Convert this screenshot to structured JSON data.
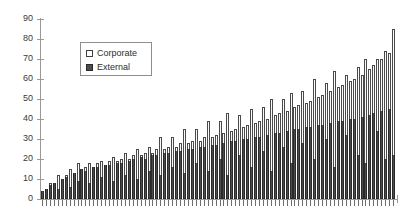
{
  "chart_data": {
    "type": "bar",
    "subtype": "stacked-bar",
    "title": "",
    "xlabel": "",
    "ylabel": "",
    "ylim": [
      0,
      90
    ],
    "ytick_labels": [
      "90",
      "80",
      "70",
      "60",
      "50",
      "40",
      "30",
      "20",
      "10",
      "0"
    ],
    "ytick_values": [
      90,
      80,
      70,
      60,
      50,
      40,
      30,
      20,
      10,
      0
    ],
    "grid": false,
    "legend_position": "upper-left-inside",
    "xtick_labels": [],
    "n_categories": 90,
    "categories": [
      "1",
      "2",
      "3",
      "4",
      "5",
      "6",
      "7",
      "8",
      "9",
      "10",
      "11",
      "12",
      "13",
      "14",
      "15",
      "16",
      "17",
      "18",
      "19",
      "20",
      "21",
      "22",
      "23",
      "24",
      "25",
      "26",
      "27",
      "28",
      "29",
      "30",
      "31",
      "32",
      "33",
      "34",
      "35",
      "36",
      "37",
      "38",
      "39",
      "40",
      "41",
      "42",
      "43",
      "44",
      "45",
      "46",
      "47",
      "48",
      "49",
      "50",
      "51",
      "52",
      "53",
      "54",
      "55",
      "56",
      "57",
      "58",
      "59",
      "60",
      "61",
      "62",
      "63",
      "64",
      "65",
      "66",
      "67",
      "68",
      "69",
      "70",
      "71",
      "72",
      "73",
      "74",
      "75",
      "76",
      "77",
      "78",
      "79",
      "80",
      "81",
      "82",
      "83",
      "84",
      "85",
      "86",
      "87",
      "88",
      "89",
      "90"
    ],
    "series": [
      {
        "name": "External",
        "color": "#4c4c4c",
        "values": [
          4,
          5,
          7,
          8,
          5,
          10,
          11,
          6,
          13,
          9,
          15,
          14,
          8,
          16,
          16,
          11,
          17,
          17,
          9,
          18,
          18,
          12,
          19,
          20,
          10,
          21,
          20,
          14,
          22,
          22,
          12,
          23,
          23,
          16,
          24,
          24,
          13,
          25,
          25,
          18,
          26,
          26,
          14,
          27,
          27,
          20,
          28,
          12,
          29,
          29,
          22,
          30,
          30,
          16,
          31,
          31,
          24,
          32,
          14,
          33,
          33,
          26,
          34,
          18,
          35,
          35,
          28,
          36,
          36,
          20,
          37,
          37,
          30,
          38,
          16,
          39,
          39,
          32,
          40,
          40,
          22,
          41,
          18,
          42,
          43,
          34,
          44,
          20,
          45,
          22
        ]
      },
      {
        "name": "Corporate",
        "color": "#fbfbfb",
        "values": [
          0,
          0,
          1,
          0,
          7,
          0,
          1,
          9,
          0,
          9,
          0,
          2,
          10,
          0,
          2,
          8,
          0,
          2,
          12,
          1,
          2,
          11,
          1,
          2,
          15,
          1,
          3,
          12,
          1,
          3,
          19,
          2,
          3,
          15,
          2,
          4,
          22,
          3,
          4,
          17,
          3,
          5,
          25,
          4,
          5,
          19,
          5,
          31,
          5,
          6,
          20,
          6,
          7,
          29,
          7,
          8,
          22,
          8,
          36,
          9,
          10,
          24,
          10,
          35,
          11,
          12,
          26,
          12,
          13,
          40,
          14,
          15,
          28,
          16,
          48,
          17,
          18,
          30,
          19,
          20,
          44,
          21,
          52,
          23,
          24,
          36,
          26,
          54,
          28,
          63
        ]
      }
    ]
  },
  "legend": {
    "items": [
      {
        "label": "Corporate",
        "swatch": "corporate"
      },
      {
        "label": "External",
        "swatch": "external"
      }
    ]
  }
}
